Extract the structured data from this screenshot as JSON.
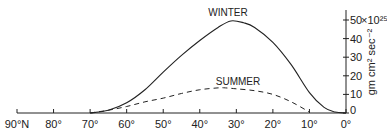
{
  "chart_data": {
    "type": "line",
    "title": "",
    "xlabel": "Latitude",
    "ylabel": "gm cm² sec⁻²",
    "y_multiplier": "×10²⁵",
    "x_ticks": [
      "90°N",
      "80°",
      "70°",
      "60°",
      "50°",
      "40°",
      "30°",
      "20°",
      "10°",
      "0°"
    ],
    "x_values": [
      90,
      80,
      70,
      60,
      50,
      40,
      30,
      20,
      10,
      0
    ],
    "y_ticks": [
      "0",
      "10",
      "20",
      "30",
      "40",
      "50"
    ],
    "ylim": [
      0,
      55
    ],
    "xlim": [
      90,
      0
    ],
    "grid": false,
    "legend": "inline labels",
    "series": [
      {
        "name": "WINTER",
        "style": "solid",
        "x": [
          70,
          65,
          60,
          55,
          50,
          45,
          40,
          35,
          31.5,
          28,
          25,
          20,
          15,
          10,
          6,
          3,
          0
        ],
        "values": [
          0,
          1.5,
          5.5,
          12.5,
          22,
          31,
          39,
          46,
          49.5,
          48.5,
          46,
          38,
          26,
          11,
          3,
          0.5,
          0
        ]
      },
      {
        "name": "SUMMER",
        "style": "dashed",
        "x": [
          70,
          65,
          60,
          55,
          50,
          45,
          40,
          35,
          33,
          30,
          25,
          20,
          15,
          10
        ],
        "values": [
          0,
          1.5,
          3.5,
          6,
          8,
          10.5,
          12.5,
          13.5,
          13.5,
          13,
          12,
          10,
          6,
          0.5
        ]
      }
    ],
    "annotations": [
      "WINTER",
      "SUMMER"
    ]
  }
}
